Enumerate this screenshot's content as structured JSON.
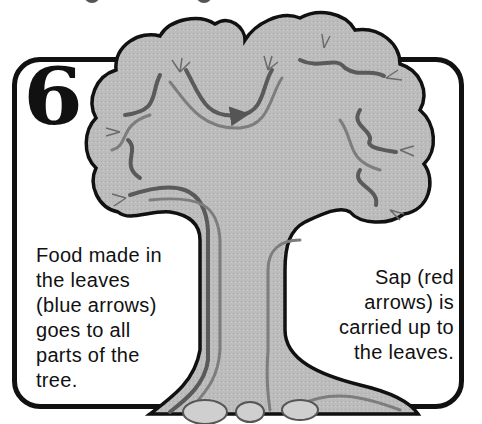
{
  "figure": {
    "step_number": "6",
    "caption_left": {
      "lines": [
        "Food made in",
        "the leaves",
        "(blue arrows)",
        "goes to all",
        "parts of the",
        "tree."
      ]
    },
    "caption_right": {
      "lines": [
        "Sap (red",
        "arrows) is",
        "carried up to",
        "the leaves."
      ]
    },
    "colors": {
      "tree_fill": "#b9b9b9",
      "outline": "#111111",
      "food_arrow": "#5a5a5a",
      "sap_arrow": "#7a7a7a",
      "background": "#ffffff"
    },
    "illustration": "tree-canopy-and-trunk-with-flow-arrows"
  }
}
